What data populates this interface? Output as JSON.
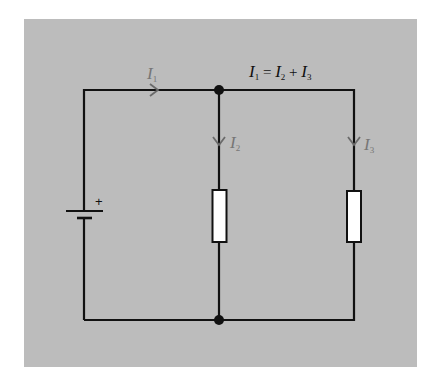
{
  "diagram": {
    "equation": {
      "lhs": "I",
      "lhs_sub": "1",
      "eq": " = ",
      "a": "I",
      "a_sub": "2",
      "plus": " + ",
      "b": "I",
      "b_sub": "3"
    },
    "labels": {
      "i1": {
        "main": "I",
        "sub": "1"
      },
      "i2": {
        "main": "I",
        "sub": "2"
      },
      "i3": {
        "main": "I",
        "sub": "3"
      },
      "battery_plus": "+"
    },
    "colors": {
      "background": "#bcbcbc",
      "wire": "#111111",
      "current_label": "#767676",
      "resistor_fill": "#ffffff"
    }
  }
}
